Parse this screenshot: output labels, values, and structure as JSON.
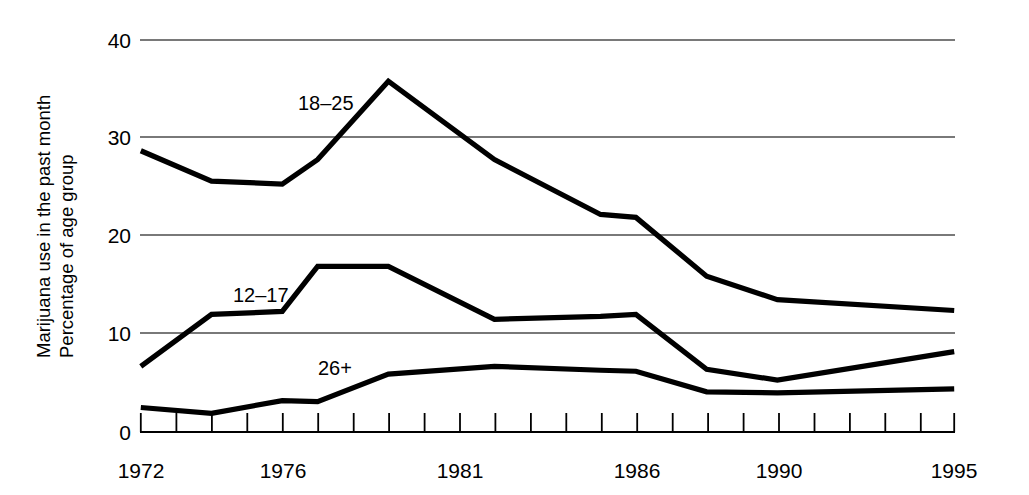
{
  "chart_data": {
    "type": "line",
    "title": "",
    "subtitle": "",
    "xlabel": "",
    "ylabel": "Marijuana use in the past month\nPercentage of age group",
    "ylabel_line1": "Marijuana use in the past month",
    "ylabel_line2": "Percentage of age group",
    "xlim": [
      1972,
      1995
    ],
    "ylim": [
      0,
      40
    ],
    "yticks": [
      0,
      10,
      20,
      30,
      40
    ],
    "ytick_labels": [
      "0",
      "10",
      "20",
      "30",
      "40"
    ],
    "xticks": [
      1972,
      1973,
      1974,
      1975,
      1976,
      1977,
      1978,
      1979,
      1980,
      1981,
      1982,
      1983,
      1984,
      1985,
      1986,
      1987,
      1988,
      1989,
      1990,
      1991,
      1992,
      1993,
      1994,
      1995
    ],
    "xtick_labels_shown": [
      "1972",
      "1976",
      "1981",
      "1986",
      "1990",
      "1995"
    ],
    "xtick_label_years": [
      1972,
      1976,
      1981,
      1986,
      1990,
      1995
    ],
    "grid": "horizontal-only",
    "grid_values": [
      10,
      20,
      30,
      40
    ],
    "legend_position": "inline-annotations",
    "line_color": "#000000",
    "grid_color": "#555555",
    "axis_color": "#000000",
    "series": [
      {
        "name": "18-25",
        "label": "18–25",
        "x": [
          1972,
          1974,
          1976,
          1977,
          1979,
          1982,
          1985,
          1986,
          1988,
          1990,
          1995
        ],
        "values": [
          28.7,
          25.6,
          25.3,
          27.8,
          35.8,
          27.8,
          22.2,
          21.9,
          15.9,
          13.5,
          12.4
        ]
      },
      {
        "name": "12-17",
        "label": "12–17",
        "x": [
          1972,
          1974,
          1976,
          1977,
          1979,
          1982,
          1985,
          1986,
          1988,
          1990,
          1995
        ],
        "values": [
          6.7,
          12.0,
          12.3,
          16.9,
          16.9,
          11.5,
          11.8,
          12.0,
          6.4,
          5.3,
          8.2
        ]
      },
      {
        "name": "26+",
        "label": "26+",
        "x": [
          1972,
          1974,
          1976,
          1977,
          1979,
          1982,
          1985,
          1986,
          1988,
          1990,
          1995
        ],
        "values": [
          2.5,
          1.9,
          3.2,
          3.1,
          5.9,
          6.7,
          6.3,
          6.2,
          4.1,
          4.0,
          4.4
        ]
      }
    ],
    "annotations": [
      {
        "text": "18–25",
        "x_px": 298,
        "y_px": 110
      },
      {
        "text": "12–17",
        "x_px": 233,
        "y_px": 302
      },
      {
        "text": "26+",
        "x_px": 318,
        "y_px": 375
      }
    ]
  }
}
